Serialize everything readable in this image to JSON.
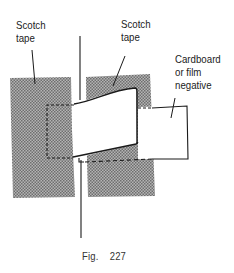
{
  "labels": {
    "tape_left": [
      "Scotch",
      "tape"
    ],
    "tape_right": [
      "Scotch",
      "tape"
    ],
    "cardboard": [
      "Cardboard",
      "or film",
      "negative"
    ]
  },
  "caption": {
    "prefix": "Fig.",
    "number": "227"
  },
  "colors": {
    "tape_fill": "#8f8f8f",
    "line": "#1a1a1a",
    "background": "#ffffff"
  }
}
